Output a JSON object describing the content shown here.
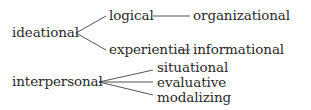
{
  "diagram": {
    "nodes": {
      "ideational": "ideational",
      "logical": "logical",
      "experiential": "experiential",
      "organizational": "organizational",
      "informational": "informational",
      "interpersonal": "interpersonal",
      "situational": "situational",
      "evaluative": "evaluative",
      "modalizing": "modalizing"
    },
    "edges": [
      [
        "ideational",
        "logical"
      ],
      [
        "ideational",
        "experiential"
      ],
      [
        "logical",
        "organizational"
      ],
      [
        "experiential",
        "informational"
      ],
      [
        "interpersonal",
        "situational"
      ],
      [
        "interpersonal",
        "evaluative"
      ],
      [
        "interpersonal",
        "modalizing"
      ]
    ],
    "colors": {
      "text": "#2a2a2a",
      "line": "#555555",
      "background": "#ffffff"
    }
  }
}
